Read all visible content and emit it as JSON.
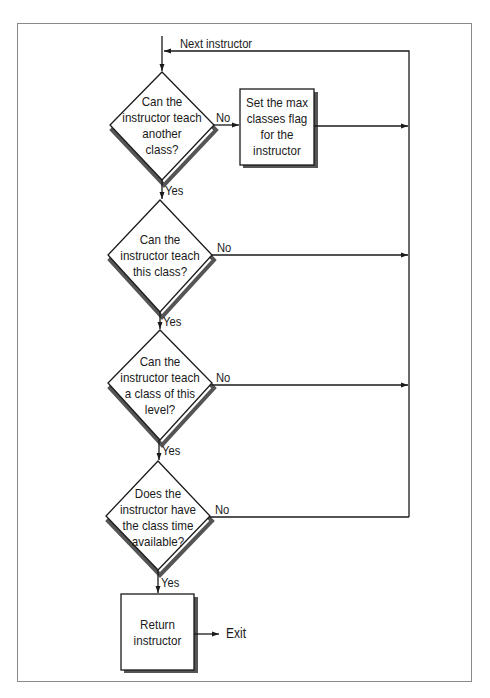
{
  "diagram": {
    "type": "flowchart",
    "entry_label": "Next instructor",
    "decisions": [
      {
        "id": "d1",
        "lines": [
          "Can the",
          "instructor teach",
          "another",
          "class?"
        ],
        "no_label": "No",
        "yes_label": "Yes"
      },
      {
        "id": "d2",
        "lines": [
          "Can the",
          "instructor teach",
          "this class?"
        ],
        "no_label": "No",
        "yes_label": "Yes"
      },
      {
        "id": "d3",
        "lines": [
          "Can the",
          "instructor teach",
          "a class of this",
          "level?"
        ],
        "no_label": "No",
        "yes_label": "Yes"
      },
      {
        "id": "d4",
        "lines": [
          "Does the",
          "instructor have",
          "the class time",
          "available?"
        ],
        "no_label": "No",
        "yes_label": "Yes"
      }
    ],
    "processes": [
      {
        "id": "p1",
        "lines": [
          "Set the max",
          "classes flag",
          "for the",
          "instructor"
        ]
      },
      {
        "id": "p2",
        "lines": [
          "Return",
          "instructor"
        ]
      }
    ],
    "exit_label": "Exit",
    "colors": {
      "line": "#1a1a1a",
      "shadow": "#555555",
      "frame": "#8a8a8a",
      "fill": "#ffffff"
    }
  }
}
